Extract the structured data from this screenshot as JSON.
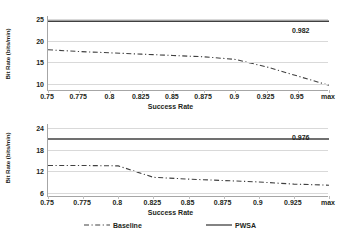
{
  "chart_data": [
    {
      "id": "top",
      "type": "line",
      "title": "",
      "xlabel": "Success Rate",
      "ylabel": "Bit Rate (bits/min)",
      "xticklabels": [
        "0.75",
        "0.775",
        "0.8",
        "0.825",
        "0.85",
        "0.875",
        "0.9",
        "0.925",
        "0.95",
        "max"
      ],
      "yticklabels": [
        "10",
        "15",
        "20",
        "25"
      ],
      "ylim": [
        8.5,
        25.6
      ],
      "yticks": [
        10,
        15,
        20,
        25
      ],
      "grid": true,
      "legend_position": "bottom",
      "annotations": [
        {
          "text": "0.982",
          "series": "PWSA"
        }
      ],
      "series": [
        {
          "name": "Baseline",
          "style": "dash-dot",
          "color": "#404040",
          "x": [
            0,
            1,
            2,
            3,
            4,
            5,
            6,
            7,
            8,
            9
          ],
          "values": [
            17.9,
            17.5,
            17.2,
            16.9,
            16.6,
            16.3,
            15.7,
            14.0,
            11.9,
            9.8
          ]
        },
        {
          "name": "PWSA",
          "style": "solid",
          "color": "#404040",
          "x": [
            0,
            9
          ],
          "values": [
            24.4,
            24.4
          ]
        }
      ]
    },
    {
      "id": "bottom",
      "type": "line",
      "title": "",
      "xlabel": "Success Rate",
      "ylabel": "Bit Rate (bits/min)",
      "xticklabels": [
        "0.75",
        "0.775",
        "0.8",
        "0.825",
        "0.85",
        "0.875",
        "0.9",
        "0.925",
        "max"
      ],
      "yticklabels": [
        "6",
        "12",
        "18",
        "24"
      ],
      "ylim": [
        4.8,
        25.2
      ],
      "yticks": [
        6,
        12,
        18,
        24
      ],
      "grid": true,
      "legend_position": "bottom",
      "annotations": [
        {
          "text": "0.976",
          "series": "PWSA"
        }
      ],
      "series": [
        {
          "name": "Baseline",
          "style": "dash-dot",
          "color": "#404040",
          "x": [
            0,
            1,
            2,
            3,
            4,
            5,
            6,
            7,
            8
          ],
          "values": [
            13.6,
            13.6,
            13.5,
            10.3,
            9.8,
            9.4,
            9.0,
            8.4,
            8.1
          ]
        },
        {
          "name": "PWSA",
          "style": "solid",
          "color": "#404040",
          "x": [
            0,
            8
          ],
          "values": [
            21.0,
            21.0
          ]
        }
      ]
    }
  ],
  "legend": {
    "baseline_label": "Baseline",
    "pwsa_label": "PWSA"
  }
}
